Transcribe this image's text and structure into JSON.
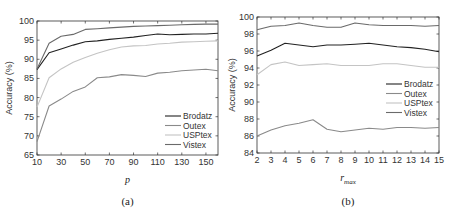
{
  "chart_data": [
    {
      "type": "line",
      "id": "a",
      "caption": "(a)",
      "title": "",
      "xlabel": "p",
      "ylabel": "Accuracy (%)",
      "xlim": [
        10,
        160
      ],
      "ylim": [
        65,
        100
      ],
      "xticks": [
        10,
        30,
        50,
        70,
        90,
        110,
        130,
        150
      ],
      "yticks": [
        65,
        70,
        75,
        80,
        85,
        90,
        95,
        100
      ],
      "grid": false,
      "legend_position": "lower right",
      "x": [
        10,
        20,
        30,
        40,
        50,
        60,
        70,
        80,
        90,
        100,
        110,
        120,
        130,
        140,
        150,
        160
      ],
      "series": [
        {
          "name": "Brodatz",
          "color": "#222222",
          "values": [
            87.3,
            91.7,
            92.7,
            93.7,
            94.6,
            94.8,
            95.2,
            95.5,
            95.8,
            96.2,
            96.6,
            96.4,
            96.5,
            96.6,
            96.6,
            96.8
          ]
        },
        {
          "name": "Outex",
          "color": "#8a8a8a",
          "values": [
            68.5,
            77.8,
            79.6,
            81.6,
            82.8,
            85.2,
            85.4,
            86.0,
            85.8,
            85.5,
            86.4,
            86.6,
            87.0,
            87.2,
            87.4,
            87.0
          ]
        },
        {
          "name": "USPtex",
          "color": "#c4c4c4",
          "values": [
            77.5,
            85.2,
            87.5,
            89.2,
            90.5,
            91.6,
            92.5,
            93.2,
            93.5,
            93.6,
            94.0,
            94.2,
            94.5,
            94.6,
            94.7,
            94.8
          ]
        },
        {
          "name": "Vistex",
          "color": "#6a6a6a",
          "values": [
            87.5,
            94.2,
            96.0,
            96.5,
            97.8,
            98.0,
            98.2,
            98.4,
            98.6,
            98.7,
            98.8,
            98.9,
            99.0,
            99.1,
            99.2,
            99.2
          ]
        }
      ]
    },
    {
      "type": "line",
      "id": "b",
      "caption": "(b)",
      "title": "",
      "xlabel": "r_max",
      "xlabel_main": "r",
      "xlabel_sub": "max",
      "ylabel": "Accuracy (%)",
      "xlim": [
        2,
        15
      ],
      "ylim": [
        84,
        100
      ],
      "xticks": [
        2,
        3,
        4,
        5,
        6,
        7,
        8,
        9,
        10,
        11,
        12,
        13,
        14,
        15
      ],
      "yticks": [
        84,
        86,
        88,
        90,
        92,
        94,
        96,
        98,
        100
      ],
      "grid": false,
      "legend_position": "center right",
      "x": [
        2,
        3,
        4,
        5,
        6,
        7,
        8,
        9,
        10,
        11,
        12,
        13,
        14,
        15
      ],
      "series": [
        {
          "name": "Brodatz",
          "color": "#222222",
          "values": [
            95.4,
            96.1,
            96.9,
            96.7,
            96.5,
            96.7,
            96.7,
            96.8,
            96.9,
            96.7,
            96.5,
            96.4,
            96.2,
            95.9
          ]
        },
        {
          "name": "Outex",
          "color": "#8a8a8a",
          "values": [
            86.0,
            86.7,
            87.2,
            87.5,
            87.9,
            86.8,
            86.5,
            86.7,
            86.9,
            86.8,
            87.0,
            87.0,
            86.9,
            87.0
          ]
        },
        {
          "name": "USPtex",
          "color": "#c4c4c4",
          "values": [
            93.2,
            94.4,
            94.7,
            94.3,
            94.4,
            94.5,
            94.3,
            94.3,
            94.3,
            94.5,
            94.5,
            94.3,
            94.1,
            94.1
          ]
        },
        {
          "name": "Vistex",
          "color": "#6a6a6a",
          "values": [
            98.5,
            98.9,
            99.0,
            99.3,
            99.0,
            98.8,
            98.8,
            99.3,
            99.1,
            99.0,
            99.0,
            99.0,
            98.9,
            99.0
          ]
        }
      ]
    }
  ]
}
